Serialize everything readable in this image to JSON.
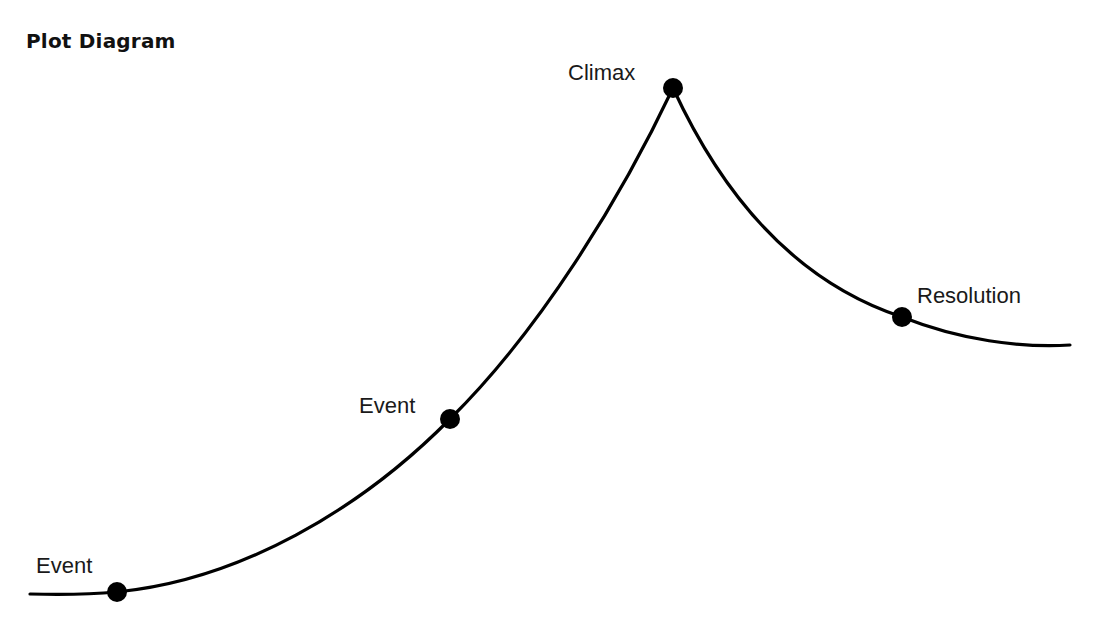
{
  "title": "Plot Diagram",
  "points": [
    {
      "label": "Event",
      "x": 117,
      "y": 592,
      "label_x": 36,
      "label_y": 573
    },
    {
      "label": "Event",
      "x": 450,
      "y": 419,
      "label_x": 359,
      "label_y": 413
    },
    {
      "label": "Climax",
      "x": 673,
      "y": 88,
      "label_x": 568,
      "label_y": 80
    },
    {
      "label": "Resolution",
      "x": 902,
      "y": 317,
      "label_x": 917,
      "label_y": 303
    }
  ],
  "colors": {
    "line": "#000000",
    "dot": "#000000",
    "text": "#1a1a1a"
  }
}
